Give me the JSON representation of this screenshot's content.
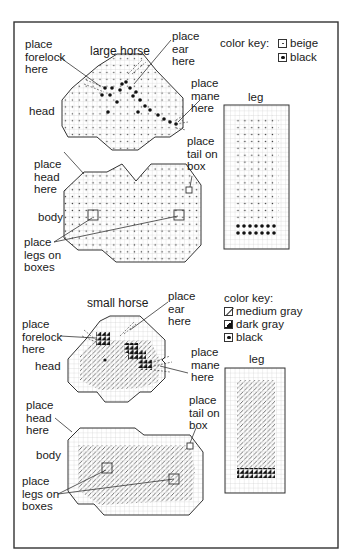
{
  "figure": {
    "frame_color": "#333333",
    "grid_color": "#cfcfcf",
    "outline_color": "#333333"
  },
  "large_horse": {
    "title": "large horse",
    "labels": {
      "forelock": "place\nforelock\nhere",
      "ear": "place\near\nhere",
      "mane": "place\nmane\nhere",
      "head": "head",
      "head_here": "place\nhead\nhere",
      "tail": "place\ntail on\nbox",
      "body": "body",
      "legs": "place\nlegs on\nboxes",
      "leg": "leg"
    },
    "color_key": {
      "title": "color key:",
      "items": [
        {
          "swatch": "beige",
          "label": "beige"
        },
        {
          "swatch": "black",
          "label": "black"
        }
      ]
    },
    "pieces": [
      "head",
      "body",
      "leg"
    ]
  },
  "small_horse": {
    "title": "small horse",
    "labels": {
      "forelock": "place\nforelock\nhere",
      "ear": "place\near\nhere",
      "mane": "place\nmane\nhere",
      "head": "head",
      "head_here": "place\nhead\nhere",
      "tail": "place\ntail on\nbox",
      "body": "body",
      "legs": "place\nlegs on\nboxes",
      "leg": "leg"
    },
    "color_key": {
      "title": "color key:",
      "items": [
        {
          "swatch": "medium-gray",
          "label": "medium gray"
        },
        {
          "swatch": "dark-gray",
          "label": "dark gray"
        },
        {
          "swatch": "black",
          "label": "black"
        }
      ]
    },
    "pieces": [
      "head",
      "body",
      "leg"
    ]
  }
}
